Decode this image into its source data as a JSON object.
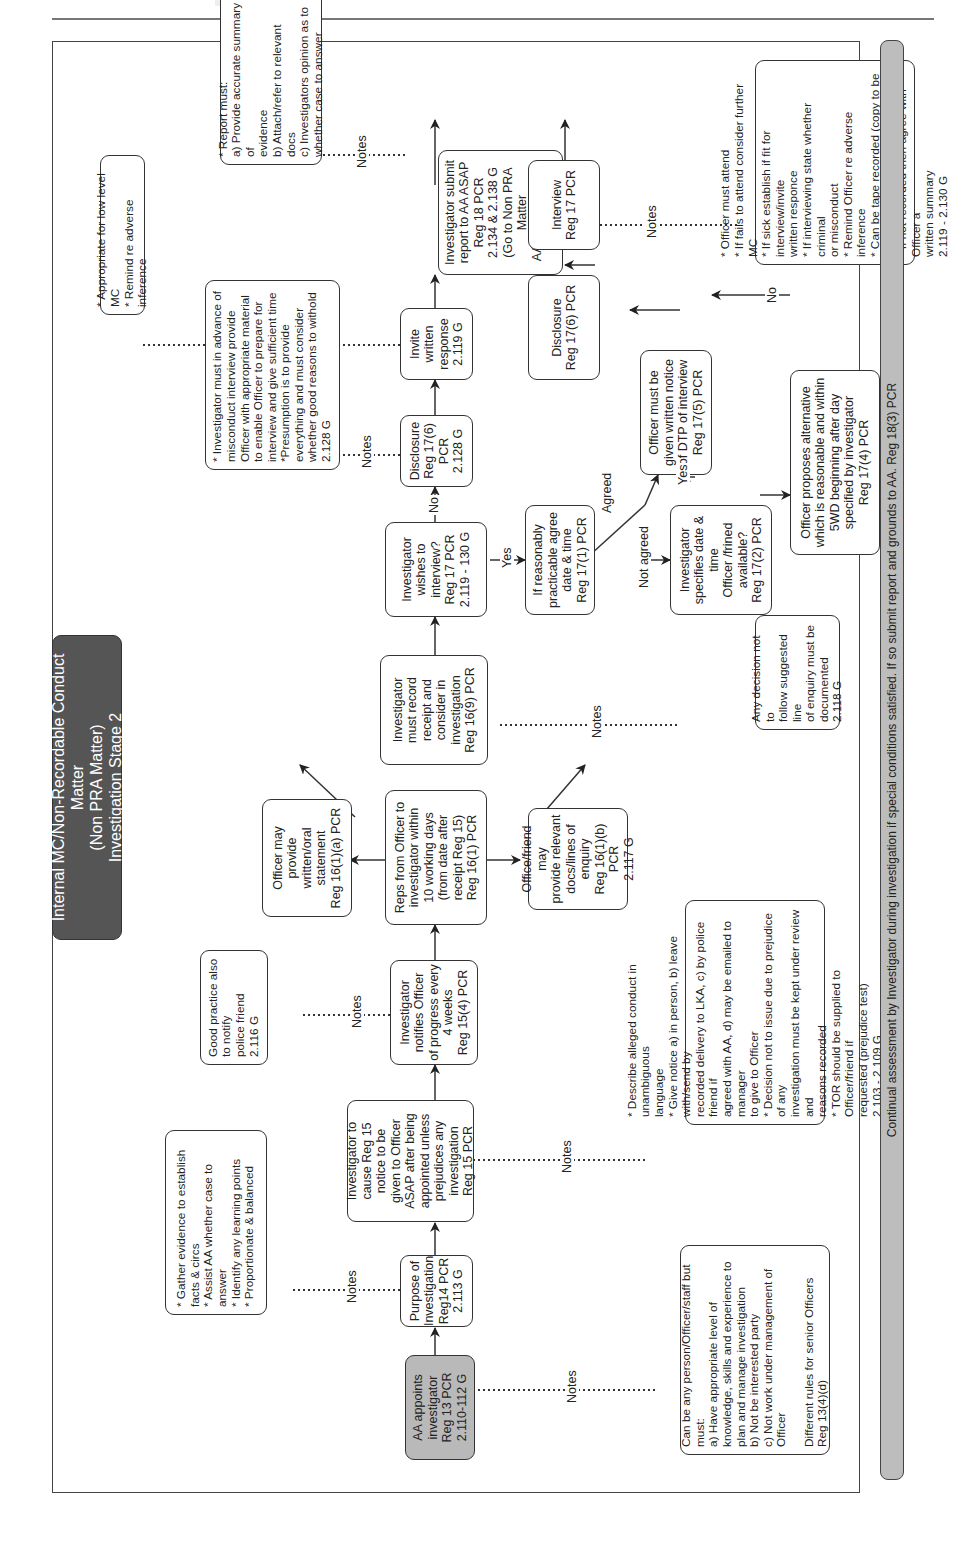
{
  "title": "Internal MC/Non-Recordable Conduct Matter\n(Non PRA Matter)\nInvestigation Stage 2",
  "notes_label": "Notes",
  "nodes": {
    "aa_appoints": "AA appoints\ninvestigator\nReg 13 PCR\n2.110-112 G",
    "purpose": "Purpose of\nInvestigation\nReg14 PCR\n2.113 G",
    "reg15_notice": "Investigator to\ncause Reg 15\nnotice to be\ngiven to Officer\nASAP after being\nappointed unless\nprejudices any\ninvestigation\nReg 15 PCR",
    "notifies_progress": "Investigator\nnotifies Officer\nof progress every\n4 weeks\nReg 15(4) PCR",
    "reps_from_officer": "Reps from Officer to\ninvestigator within\n10 working days\n(from date after\nreceipt Reg 15)\nReg 16(1) PCR",
    "officer_statement": "Officer may\nprovide\nwritten/oral\nstatement\nReg 16(1)(a) PCR",
    "officer_friend_docs": "Office/friend may\nprovide relevant\ndocs/lines of\nenquiry\nReg 16(1)(b) PCR\n2.117 G",
    "record_receipt": "Investigator\nmust record\nreceipt and\nconsider in\ninvestigation\nReg 16(9) PCR",
    "wishes_interview": "Investigator\nwishes to\ninterview?\nReg 17 PCR\n2.119 - 130 G",
    "disclosure_written": "Disclosure\nReg 17(6) PCR\n2.128 G",
    "invite_written": "Invite written\nresponse\n2.119 G",
    "submit_report": "Investigator submit\nreport to AA ASAP\nReg 18 PCR\n2.134 & 2.138 G\n(Go to Non PRA Matter\nAA Determination\nStage 3)",
    "agree_date": "If reasonably\npracticable agree\ndate & time\nReg 17(1) PCR",
    "specifies_date": "Investigator\nspecifies date &\ntime\nOfficer /frined\navailable?\nReg 17(2) PCR",
    "written_notice": "Officer must be\ngiven written notice\nof DTP of interview\nReg 17(5) PCR",
    "officer_proposes": "Officer proposes alternative\nwhich is reasonable and within\n5WD beginning after day\nspecified by investigator\nReg 17(4) PCR",
    "disclosure_interview": "Disclosure\nReg 17(6) PCR",
    "interview": "Interview\nReg 17 PCR"
  },
  "edge_labels": {
    "no": "No",
    "yes": "Yes",
    "agreed": "Agreed",
    "not_agreed": "Not agreed"
  },
  "notes": {
    "purpose": "* Gather evidence to establish\nfacts & circs\n* Assist AA whether case to\nanswer\n* Identify any learning points\n* Proportionate & balanced",
    "progress": "Good practice also to notify\npolice friend\n2.116 G",
    "disclosure": "* Investigator must in advance of\nmisconduct interview provide\nOfficer with appropriate material\nto enable Officer to prepare for\ninterview and give sufficient time\n*Presumption is to provide\neverything and must consider\nwhether good reasons to withold\n2.128 G",
    "invite_written": "* Appropriate for low level MC\n* Remind re adverse inference",
    "report": "* Report must:\na) Provide accurate summary of\nevidence\nb) Attach/refer to relevant docs\nc) Investigators opinion as to\nwhether case to answer",
    "record_receipt": "Any decision not to\nfollow suggested line\nof enquiry must be\ndocumented\n2.118 G",
    "interview": "* Officer must attend\n* If fails to attend consider further MC\n* If sick establish if fit for interview/invite\nwritten responce\n* If interviewing state whether criminal\nor misconduct\n* Remind Officer re adverse inference\n* Can be tape recorded (copy to be\nprovided on request)\n* If not recorded then agree with Officer a\nwritten summary\n2.119 - 2.130 G",
    "reg15": "* Describe alleged conduct in unambiguous\nlanguage\n* Give notice a) in person, b) leave with/send by\nrecorded delivery to LKA, c) by police friend if\nagreed with AA, d) may be emailed to manager\nto give to Officer\n* Decision not to issue due to prejudice of any\ninvestigation must be kept under review and\nreasons recorded\n* TOR should be supplied to Officer/friend if\nrequested (prejudice test)\n2.103 - 2.109 G",
    "aa_appoints": "Can be any person/Officer/staff but\nmust:\na) Have appropriate level of\nknowledge, skills and experience to\nplan and manage investigation\nb) Not be interested party\nc) Not work under management of\nOfficer\n\nDifferent rules for senior Officers\nReg 13(4)(d)"
  },
  "footer_banner": "Continual assessment by Investigator during investigation if special conditions satisfied. If so submit report and grounds to AA. Reg 18(3) PCR",
  "colors": {
    "shaded_box": "#b9b9b9",
    "title_bg": "#555555",
    "line": "#333333",
    "banner": "#bdbdbd"
  }
}
